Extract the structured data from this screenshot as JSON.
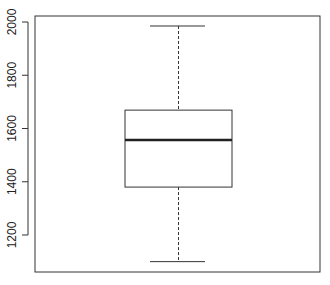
{
  "chart_data": {
    "type": "boxplot",
    "title": "",
    "xlabel": "",
    "ylabel": "",
    "ylim": [
      1060,
      2020
    ],
    "yticks": [
      1200,
      1400,
      1600,
      1800,
      2000
    ],
    "ytick_labels": [
      "1200",
      "1400",
      "1600",
      "1800",
      "2000"
    ],
    "grid": false,
    "legend": null,
    "boxes": [
      {
        "min": 1100,
        "q1": 1380,
        "median": 1557,
        "q3": 1669,
        "max": 1985
      }
    ]
  }
}
